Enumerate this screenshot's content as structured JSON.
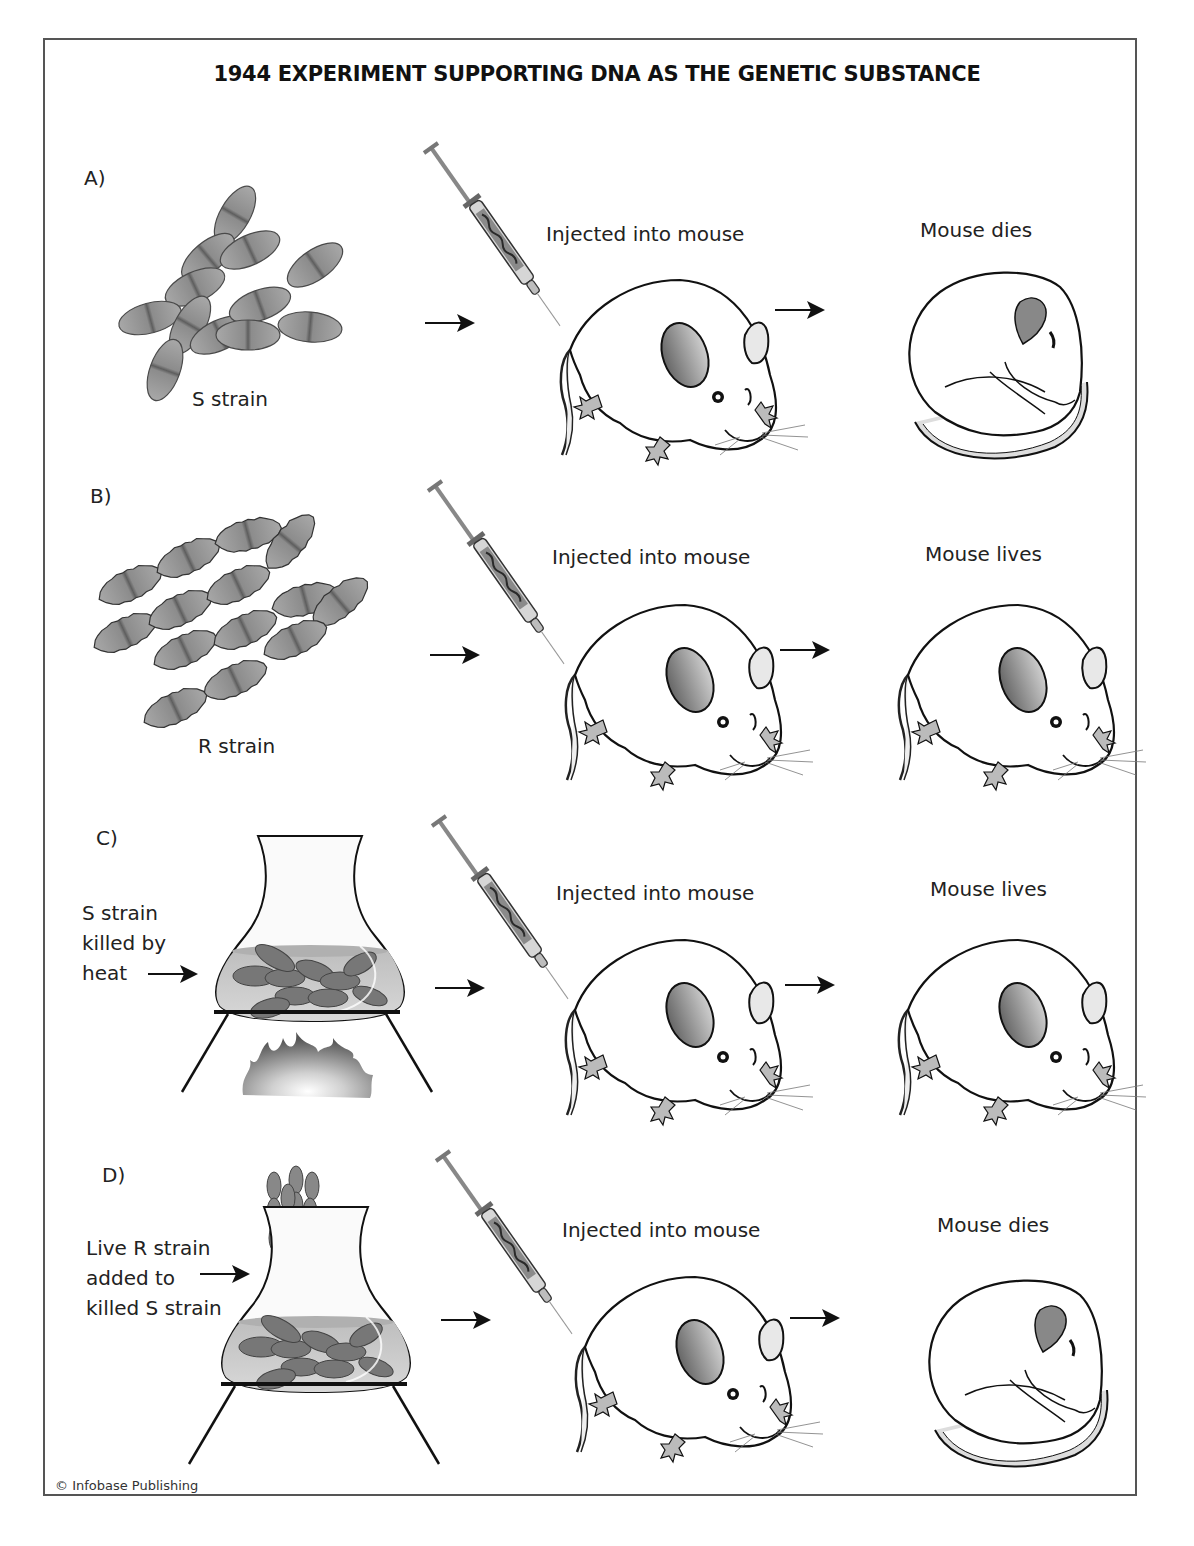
{
  "title": "1944 EXPERIMENT SUPPORTING DNA AS THE GENETIC SUBSTANCE",
  "colors": {
    "frame": "#555555",
    "bacteria_fill": "#8a8a8a",
    "bacteria_stroke": "#444444",
    "flask_liquid": "#c9c9c9",
    "flame": "#6e6e6e",
    "ink": "#1a1a1a"
  },
  "panels": [
    {
      "letter": "A)",
      "sample_label": "S strain",
      "sample_icon": "s-strain-bacteria-icon",
      "step_label": "Injected into mouse",
      "outcome_label": "Mouse dies",
      "outcome_state": "dead"
    },
    {
      "letter": "B)",
      "sample_label": "R strain",
      "sample_icon": "r-strain-bacteria-icon",
      "step_label": "Injected into mouse",
      "outcome_label": "Mouse lives",
      "outcome_state": "alive"
    },
    {
      "letter": "C)",
      "side_note": [
        "S strain",
        "killed by",
        "heat"
      ],
      "sample_icon": "heated-flask-icon",
      "step_label": "Injected into mouse",
      "outcome_label": "Mouse lives",
      "outcome_state": "alive"
    },
    {
      "letter": "D)",
      "side_note": [
        "Live R strain",
        "added to",
        "killed S strain"
      ],
      "sample_icon": "mixed-flask-icon",
      "step_label": "Injected into mouse",
      "outcome_label": "Mouse dies",
      "outcome_state": "dead"
    }
  ],
  "copyright": "© Infobase Publishing"
}
